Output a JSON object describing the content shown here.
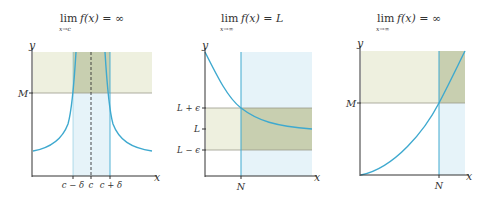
{
  "colors": {
    "curve": "#3ea9cf",
    "axis": "#333333",
    "band_yellow": "#eef0df",
    "band_blue": "#e6f3f9",
    "overlap": "#c8cfb0",
    "guide": "#9a9a8a"
  },
  "panels": [
    {
      "title_lim": "lim",
      "title_sub": "x→c",
      "title_expr": "f(x) = ∞",
      "y_label": "y",
      "x_label": "x",
      "y_ticks": [
        "M"
      ],
      "x_ticks": [
        "c − δ",
        "c",
        "c + δ"
      ]
    },
    {
      "title_lim": "lim",
      "title_sub": "x→∞",
      "title_expr": "f(x) = L",
      "y_label": "y",
      "x_label": "x",
      "y_ticks": [
        "L + ϵ",
        "L",
        "L − ϵ"
      ],
      "x_ticks": [
        "N"
      ]
    },
    {
      "title_lim": "lim",
      "title_sub": "x→∞",
      "title_expr": "f(x) = ∞",
      "y_label": "y",
      "x_label": "x",
      "y_ticks": [
        "M"
      ],
      "x_ticks": [
        "N"
      ]
    }
  ]
}
